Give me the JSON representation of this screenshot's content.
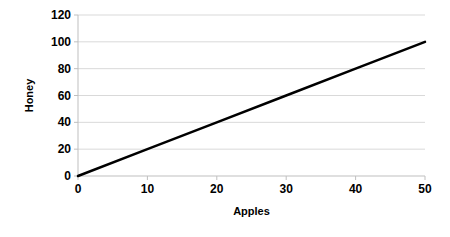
{
  "chart_data": {
    "type": "line",
    "title": "",
    "xlabel": "Apples",
    "ylabel": "Honey",
    "x": [
      0,
      50
    ],
    "series": [
      {
        "name": "Honey",
        "values": [
          0,
          100
        ],
        "color": "#000000"
      }
    ],
    "points": [
      {
        "x": 0,
        "y": 0
      },
      {
        "x": 10,
        "y": 20
      },
      {
        "x": 20,
        "y": 40
      },
      {
        "x": 30,
        "y": 60
      },
      {
        "x": 40,
        "y": 80
      },
      {
        "x": 50,
        "y": 100
      }
    ],
    "relation": "Honey = 2 x Apples",
    "xlim": [
      0,
      50
    ],
    "ylim": [
      0,
      120
    ],
    "x_ticks": [
      "0",
      "10",
      "20",
      "30",
      "40",
      "50"
    ],
    "y_ticks": [
      "0",
      "20",
      "40",
      "60",
      "80",
      "100",
      "120"
    ],
    "x_tick_values": [
      0,
      10,
      20,
      30,
      40,
      50
    ],
    "y_tick_values": [
      0,
      20,
      40,
      60,
      80,
      100,
      120
    ],
    "grid": {
      "horizontal": true,
      "vertical": false,
      "color": "#d9d9d9"
    },
    "legend": {
      "visible": false,
      "position": "none",
      "entries": []
    },
    "background_color": "#ffffff",
    "axis_color": "#bfbfbf",
    "line_color": "#000000",
    "line_width": 2.5
  },
  "axes": {
    "x_title": "Apples",
    "y_title": "Honey"
  }
}
